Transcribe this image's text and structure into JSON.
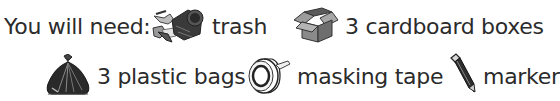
{
  "intro": {
    "label": "You will need:"
  },
  "items": [
    {
      "icon": "trash-can-icon",
      "label": "trash"
    },
    {
      "icon": "cardboard-box-icon",
      "label": "3 cardboard boxes"
    },
    {
      "icon": "plastic-bag-icon",
      "label": "3 plastic bags"
    },
    {
      "icon": "masking-tape-icon",
      "label": "masking tape"
    },
    {
      "icon": "marker-icon",
      "label": "marker"
    }
  ],
  "colors": {
    "text": "#2b2b2b",
    "icon_dark": "#2e2e2e",
    "icon_mid": "#7a7a7a",
    "icon_light": "#c8c8c8",
    "background": "#ffffff"
  }
}
